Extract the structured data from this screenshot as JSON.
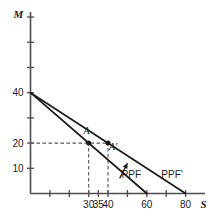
{
  "chart_data": {
    "type": "line",
    "title": "",
    "subtitle": "",
    "xlabel": "S",
    "ylabel": "M",
    "xlim": [
      0,
      90
    ],
    "ylim": [
      0,
      72
    ],
    "grid": false,
    "legend_position": "inline-end-of-line",
    "x_ticks": [
      10,
      20,
      30,
      35,
      40,
      50,
      60,
      70,
      80
    ],
    "x_tick_labels": [
      "",
      "",
      "30",
      "35",
      "40",
      "",
      "60",
      "",
      "80"
    ],
    "y_ticks": [
      10,
      20,
      30,
      40,
      50,
      60,
      70
    ],
    "y_tick_labels": [
      "10",
      "20",
      "",
      "40",
      "",
      "",
      ""
    ],
    "series": [
      {
        "name": "PPF",
        "label": "PPF",
        "points": [
          [
            0,
            40
          ],
          [
            60,
            0
          ]
        ],
        "label_x": 52,
        "label_y": 6,
        "color": "#1a1a1a"
      },
      {
        "name": "PPF'",
        "label": "PPF'",
        "points": [
          [
            0,
            40
          ],
          [
            80,
            0
          ]
        ],
        "label_x": 73,
        "label_y": 6,
        "color": "#1a1a1a"
      }
    ],
    "points": [
      {
        "name": "A",
        "label": "A",
        "x": 30,
        "y": 20,
        "label_dx": -2,
        "label_dy": -9,
        "on_series": "PPF"
      },
      {
        "name": "A'",
        "label": "A'",
        "x": 40,
        "y": 20,
        "label_dx": 5,
        "label_dy": 7,
        "on_series": "PPF'"
      }
    ],
    "guide_lines": [
      {
        "name": "horizontal-guide-m20",
        "orientation": "horizontal",
        "value": 20,
        "from": 0,
        "to": 40,
        "style": "dashed"
      },
      {
        "name": "vertical-guide-s30",
        "orientation": "vertical",
        "value": 30,
        "from": 0,
        "to": 20,
        "style": "dashed"
      },
      {
        "name": "vertical-guide-s40",
        "orientation": "vertical",
        "value": 40,
        "from": 0,
        "to": 20,
        "style": "dashed"
      }
    ],
    "annotations": [
      {
        "name": "shift-arrow",
        "type": "arrow",
        "from_x": 46,
        "from_y": 6,
        "to_x": 50,
        "to_y": 12,
        "description": "arrow pointing outward from PPF toward PPF'"
      }
    ]
  },
  "axes": {
    "y_name": "M",
    "x_name": "S"
  },
  "colors": {
    "line": "#1a1a1a",
    "axis": "#4d4d4d",
    "guide": "#555555",
    "background": "#ffffff"
  }
}
